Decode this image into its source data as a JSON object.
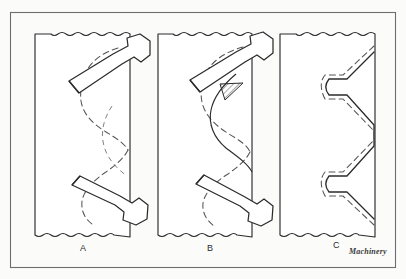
{
  "figure": {
    "background_color": "#fbfbfa",
    "line_color": "#2b2b2b",
    "dashed_color": "#555555",
    "frame": {
      "x": 10,
      "y": 12,
      "width": 386,
      "height": 256,
      "stroke": "#6e6e6e",
      "stroke_width": 1
    },
    "panels": [
      {
        "id": "A",
        "label": "A",
        "caption_position": {
          "x": 80,
          "y": 243
        },
        "description": "Blank with two rack cutter teeth engaged, dashed theoretical tooth profile partially generated",
        "blank": {
          "x": 35,
          "y": 32,
          "width": 95,
          "height": 205
        },
        "tool_count": 2,
        "hatched_area": false
      },
      {
        "id": "B",
        "label": "B",
        "caption_position": {
          "x": 207,
          "y": 243
        },
        "description": "Further generating cuts, residual uncut material shown cross-hatched near upper tooth flank",
        "blank": {
          "x": 158,
          "y": 32,
          "width": 94,
          "height": 205
        },
        "tool_count": 2,
        "hatched_area": true
      },
      {
        "id": "C",
        "label": "C",
        "caption_position": {
          "x": 333,
          "y": 240
        },
        "description": "Finished generated tooth profile, solid outline coincides with dashed theoretical curve, cutters withdrawn",
        "blank": {
          "x": 280,
          "y": 32,
          "width": 95,
          "height": 205
        },
        "tool_count": 0,
        "hatched_area": false
      }
    ],
    "credit": "Machinery",
    "legend": {
      "solid_line_meaning": "material outline produced by cutter",
      "dashed_line_meaning": "theoretical involute tooth profile"
    }
  }
}
